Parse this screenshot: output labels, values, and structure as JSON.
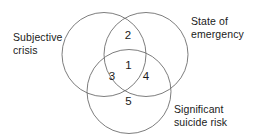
{
  "diagram": {
    "type": "venn-3-set",
    "background_color": "#ffffff",
    "stroke_color": "#6e6e6e",
    "text_color": "#1a1a1a",
    "sets": [
      {
        "key": "subjective_crisis",
        "label": "Subjective\ncrisis",
        "position": "left"
      },
      {
        "key": "state_of_emergency",
        "label": "State of\nemergency",
        "position": "top-right"
      },
      {
        "key": "significant_suicide_risk",
        "label": "Significant\nsuicide risk",
        "position": "bottom-right"
      }
    ],
    "regions": [
      {
        "key": "center-all-three",
        "number": "1",
        "description": "subjective crisis + state of emergency + significant suicide risk"
      },
      {
        "key": "top-crisis-emergency",
        "number": "2",
        "description": "subjective crisis + state of emergency"
      },
      {
        "key": "left-crisis-suicide",
        "number": "3",
        "description": "subjective crisis + significant suicide risk"
      },
      {
        "key": "right-emergency-suicide",
        "number": "4",
        "description": "state of emergency + significant suicide risk"
      },
      {
        "key": "bottom-suicide-only",
        "number": "5",
        "description": "significant suicide risk only"
      }
    ]
  }
}
